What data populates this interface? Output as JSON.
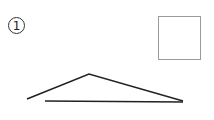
{
  "figure": {
    "label": "1",
    "square": {
      "stroke": "#9a9a9a"
    },
    "shape": {
      "stroke": "#222222",
      "polyline": [
        [
          27,
          99
        ],
        [
          89,
          74
        ],
        [
          183,
          101
        ]
      ],
      "baseline": [
        [
          45,
          101
        ],
        [
          183,
          102
        ]
      ]
    }
  }
}
